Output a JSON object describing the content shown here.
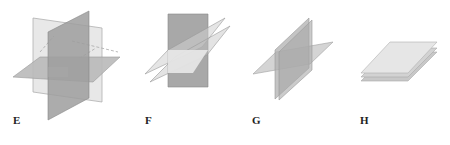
{
  "figures": [
    {
      "label": "E",
      "description": "three mutually perpendicular planes intersecting"
    },
    {
      "label": "F",
      "description": "vertical plane intersected by two parallel slanted planes"
    },
    {
      "label": "G",
      "description": "two nearly coincident vertical planes crossing one horizontal plane along a common line"
    },
    {
      "label": "H",
      "description": "three parallel stacked planes"
    }
  ],
  "colors": {
    "light_plane": "#e8e8e8",
    "mid_plane": "#b9b9b9",
    "dark_plane": "#9e9e9e",
    "edge": "#9a9a9a"
  }
}
